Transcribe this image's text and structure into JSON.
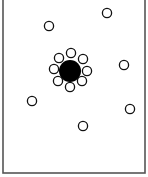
{
  "diagram": {
    "container": {
      "x": 3,
      "y": -2,
      "width": 142,
      "height": 175,
      "stroke": "#555555"
    },
    "central_particle": {
      "cx": 70,
      "cy": 71,
      "r": 11,
      "fill": "#000000"
    },
    "ring_particles": [
      {
        "cx": 71,
        "cy": 53
      },
      {
        "cx": 83,
        "cy": 59
      },
      {
        "cx": 87,
        "cy": 71
      },
      {
        "cx": 82,
        "cy": 81
      },
      {
        "cx": 70,
        "cy": 87
      },
      {
        "cx": 58,
        "cy": 81
      },
      {
        "cx": 54,
        "cy": 69
      },
      {
        "cx": 59,
        "cy": 58
      }
    ],
    "free_particles": [
      {
        "cx": 49,
        "cy": 26
      },
      {
        "cx": 107,
        "cy": 13
      },
      {
        "cx": 124,
        "cy": 65
      },
      {
        "cx": 32,
        "cy": 101
      },
      {
        "cx": 130,
        "cy": 109
      },
      {
        "cx": 83,
        "cy": 126
      }
    ],
    "small_particle_radius": 4.6,
    "small_particle_stroke": "#111111"
  }
}
